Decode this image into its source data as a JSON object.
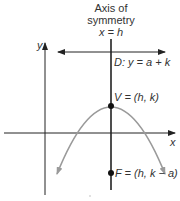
{
  "diagram": {
    "title_line1": "Axis of",
    "title_line2": "symmetry",
    "axis_equation": "x = h",
    "directrix_label": "D: y = a + k",
    "vertex_label": "V = (h, k)",
    "focus_label": "F = (h, k − a)",
    "x_axis_label": "x",
    "y_axis_label": "y",
    "colors": {
      "axes": "#222222",
      "parabola": "#9a9a9a",
      "text": "#333333",
      "points": "#111111"
    }
  }
}
